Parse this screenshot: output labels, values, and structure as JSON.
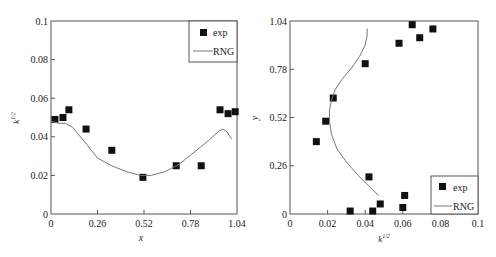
{
  "chart_data": [
    {
      "type": "scatter",
      "title": "",
      "xlabel": "x",
      "ylabel": "k^1/2",
      "xlim": [
        0,
        1.04
      ],
      "ylim": [
        0,
        0.1
      ],
      "xticks": [
        "0",
        "0.26",
        "0.52",
        "0.78",
        "1.04"
      ],
      "yticks": [
        "0",
        "0.02",
        "0.04",
        "0.06",
        "0.08",
        "0.1"
      ],
      "grid": false,
      "legend_position": "upper right",
      "series": [
        {
          "name": "exp",
          "style": "square-marker",
          "x": [
            0.022,
            0.067,
            0.1,
            0.196,
            0.34,
            0.514,
            0.7,
            0.84,
            0.945,
            0.99,
            1.03
          ],
          "y": [
            0.049,
            0.05,
            0.054,
            0.044,
            0.033,
            0.019,
            0.025,
            0.025,
            0.054,
            0.052,
            0.053
          ]
        },
        {
          "name": "RNG",
          "style": "line",
          "x": [
            0.0,
            0.05,
            0.08,
            0.12,
            0.2,
            0.26,
            0.34,
            0.42,
            0.5,
            0.56,
            0.64,
            0.72,
            0.8,
            0.88,
            0.94,
            0.96,
            0.98,
            1.01
          ],
          "y": [
            0.048,
            0.047,
            0.047,
            0.045,
            0.036,
            0.029,
            0.025,
            0.022,
            0.02,
            0.02,
            0.022,
            0.026,
            0.032,
            0.038,
            0.043,
            0.044,
            0.043,
            0.039
          ]
        }
      ]
    },
    {
      "type": "scatter",
      "title": "",
      "xlabel": "k^1/2",
      "ylabel": "y",
      "xlim": [
        0,
        0.1
      ],
      "ylim": [
        0,
        1.04
      ],
      "xticks": [
        "0",
        "0.02",
        "0.04",
        "0.06",
        "0.08",
        "0.1"
      ],
      "yticks": [
        "0",
        "0.26",
        "0.52",
        "0.78",
        "1.04"
      ],
      "grid": false,
      "legend_position": "lower right",
      "series": [
        {
          "name": "exp",
          "style": "square-marker",
          "x": [
            0.065,
            0.076,
            0.069,
            0.058,
            0.04,
            0.023,
            0.019,
            0.014,
            0.042,
            0.061,
            0.048,
            0.06,
            0.032,
            0.044
          ],
          "y": [
            1.02,
            0.997,
            0.95,
            0.92,
            0.81,
            0.625,
            0.5,
            0.39,
            0.2,
            0.1,
            0.054,
            0.035,
            0.016,
            0.016
          ]
        },
        {
          "name": "RNG",
          "style": "line",
          "x": [
            0.047,
            0.042,
            0.036,
            0.03,
            0.025,
            0.022,
            0.021,
            0.021,
            0.022,
            0.024,
            0.028,
            0.033,
            0.037,
            0.04,
            0.041,
            0.041
          ],
          "y": [
            0.1,
            0.15,
            0.21,
            0.28,
            0.35,
            0.43,
            0.5,
            0.56,
            0.61,
            0.67,
            0.73,
            0.79,
            0.85,
            0.91,
            0.96,
            1.0
          ]
        }
      ]
    }
  ],
  "left_chart": {
    "legend": {
      "exp": "exp",
      "rng": "RNG"
    },
    "xlabel": "x",
    "ylabel": "k",
    "ylabel_sup": "1/2",
    "xticks": [
      "0",
      "0.26",
      "0.52",
      "0.78",
      "1.04"
    ],
    "yticks": [
      "0",
      "0.02",
      "0.04",
      "0.06",
      "0.08",
      "0.1"
    ]
  },
  "right_chart": {
    "legend": {
      "exp": "exp",
      "rng": "RNG"
    },
    "xlabel": "k",
    "xlabel_sup": "1/2",
    "ylabel": "y",
    "xticks": [
      "0",
      "0.02",
      "0.04",
      "0.06",
      "0.08",
      "0.1"
    ],
    "yticks": [
      "0",
      "0.26",
      "0.52",
      "0.78",
      "1.04"
    ]
  }
}
